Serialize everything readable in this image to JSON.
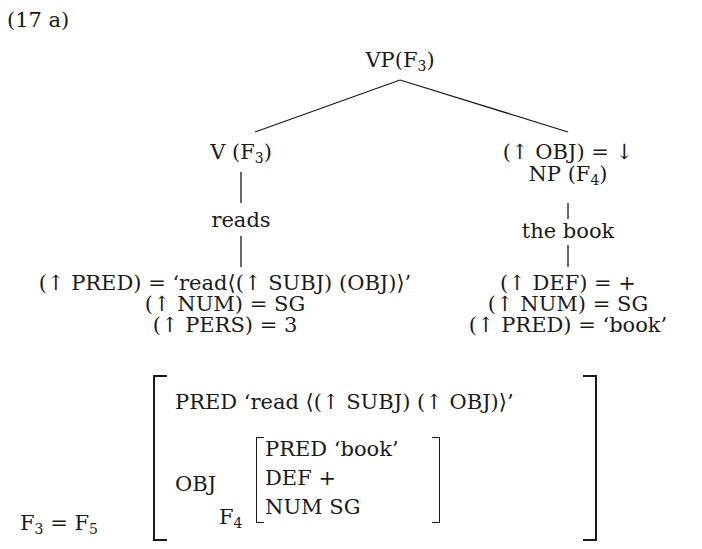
{
  "example_label": "(17 a)",
  "tree": {
    "root": {
      "label": "VP",
      "fstruct": "F",
      "fstruct_sub": "3"
    },
    "left": {
      "category": "V",
      "fstruct": "F",
      "fstruct_sub": "3",
      "word": "reads",
      "equations": [
        "(↑ PRED) = ‘read⟨(↑ SUBJ) (OBJ)⟩’",
        "(↑ NUM) = SG",
        "(↑ PERS) = 3"
      ]
    },
    "right": {
      "annotation": "(↑ OBJ) = ↓",
      "category": "NP",
      "fstruct": "F",
      "fstruct_sub": "4",
      "word": "the book",
      "equations": [
        "(↑ DEF) = +",
        "(↑ NUM) = SG",
        "(↑ PRED) = ‘book’"
      ]
    }
  },
  "fstructure": {
    "label_left": "F",
    "label_left_sub": "3",
    "eq": "=",
    "label_right": "F",
    "label_right_sub": "5",
    "pred_attr": "PRED",
    "pred_value": "‘read ⟨(↑ SUBJ) (↑ OBJ)⟩’",
    "obj_attr": "OBJ",
    "inner_label": "F",
    "inner_label_sub": "4",
    "inner_rows": [
      "PRED ‘book’",
      "DEF +",
      "NUM SG"
    ]
  }
}
